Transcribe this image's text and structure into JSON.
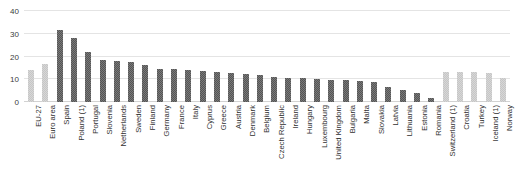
{
  "title_remnant": "",
  "axis": {
    "yticks": [
      "0",
      "10",
      "20",
      "30",
      "40"
    ],
    "ymin": 0,
    "ymax": 40,
    "ylabel": "",
    "xlabel": ""
  },
  "chart_data": {
    "type": "bar",
    "title": "",
    "subtitle": "",
    "xlabel": "",
    "ylabel": "",
    "ylim": [
      0,
      40
    ],
    "yticks": [
      0,
      10,
      20,
      30,
      40
    ],
    "grid": true,
    "legend": null,
    "orientation": "vertical",
    "categories": [
      "EU-27",
      "Euro area",
      "Spain",
      "Poland (1)",
      "Portugal",
      "Slovenia",
      "Netherlands",
      "Sweden",
      "Finland",
      "Germany",
      "France",
      "Italy",
      "Cyprus",
      "Greece",
      "Austria",
      "Denmark",
      "Belgium",
      "Czech Republic",
      "Ireland",
      "Hungary",
      "Luxembourg",
      "United Kingdom",
      "Bulgaria",
      "Malta",
      "Slovakia",
      "Latvia",
      "Lithuania",
      "Estonia",
      "Romania",
      "Switzerland (1)",
      "Croatia",
      "Turkey",
      "Iceland (1)",
      "Norway"
    ],
    "values": [
      14.0,
      16.5,
      31.5,
      28.2,
      22.2,
      18.6,
      18.2,
      17.6,
      16.1,
      14.7,
      14.6,
      14.0,
      13.8,
      13.4,
      12.7,
      12.2,
      11.9,
      11.1,
      10.6,
      10.4,
      10.2,
      9.8,
      9.5,
      9.3,
      8.7,
      6.7,
      5.4,
      4.0,
      1.8,
      13.2,
      13.0,
      13.2,
      12.6,
      10.4
    ],
    "bar_styles": [
      "light",
      "light",
      "dark",
      "dark",
      "dark",
      "dark",
      "dark",
      "dark",
      "dark",
      "dark",
      "dark",
      "dark",
      "dark",
      "dark",
      "dark",
      "dark",
      "dark",
      "dark",
      "dark",
      "dark",
      "dark",
      "dark",
      "dark",
      "dark",
      "dark",
      "dark",
      "dark",
      "dark",
      "dark",
      "light",
      "light",
      "light",
      "light",
      "light"
    ],
    "colors": {
      "aggregate_bar": "#c6c6c6",
      "country_bar": "#555555",
      "non_eu_bar": "#c6c6c6",
      "gridline": "#e4e4e4",
      "baseline": "#d2d2d2",
      "tick_text": "#3b3b3b",
      "label_text": "#2f2f2f",
      "background": "#ffffff"
    }
  }
}
